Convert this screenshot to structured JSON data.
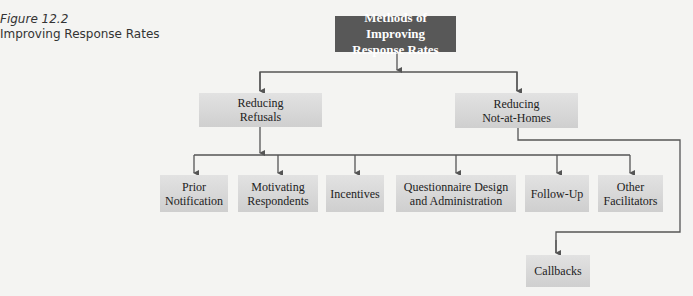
{
  "caption": {
    "figure_number": "Figure 12.2",
    "title": "Improving Response Rates"
  },
  "diagram": {
    "root": {
      "label_line1": "Methods of Improving",
      "label_line2": "Response Rates"
    },
    "branches": [
      {
        "label_line1": "Reducing",
        "label_line2": "Refusals"
      },
      {
        "label_line1": "Reducing",
        "label_line2": "Not-at-Homes"
      }
    ],
    "refusal_children": [
      {
        "label_line1": "Prior",
        "label_line2": "Notification"
      },
      {
        "label_line1": "Motivating",
        "label_line2": "Respondents"
      },
      {
        "label_line1": "Incentives",
        "label_line2": ""
      },
      {
        "label_line1": "Questionnaire Design",
        "label_line2": "and Administration"
      },
      {
        "label_line1": "Follow-Up",
        "label_line2": ""
      },
      {
        "label_line1": "Other",
        "label_line2": "Facilitators"
      }
    ],
    "not_at_home_children": [
      {
        "label_line1": "Callbacks",
        "label_line2": ""
      }
    ],
    "colors": {
      "root_fill": "#585858",
      "node_fill": "#d8d8d8",
      "connector": "#555555"
    }
  }
}
